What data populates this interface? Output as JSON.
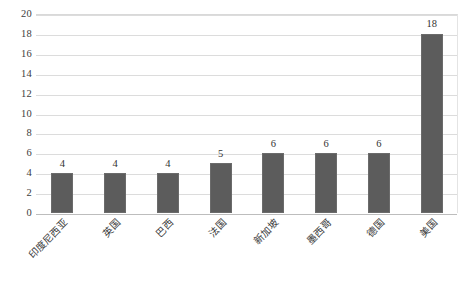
{
  "chart_data": {
    "type": "bar",
    "title": "",
    "subtitle": "",
    "xlabel": "",
    "ylabel": "",
    "categories": [
      "印度尼西亚",
      "英国",
      "巴西",
      "法国",
      "新加坡",
      "墨西哥",
      "德国",
      "美国"
    ],
    "values": [
      4,
      4,
      4,
      5,
      6,
      6,
      6,
      18
    ],
    "data_labels": [
      "4",
      "4",
      "4",
      "5",
      "6",
      "6",
      "6",
      "18"
    ],
    "ylim": [
      0,
      20
    ],
    "ytick_step": 2,
    "yticks": [
      "20",
      "18",
      "16",
      "14",
      "12",
      "10",
      "8",
      "6",
      "4",
      "2",
      "0"
    ],
    "grid": true,
    "grid_axis": "y",
    "legend": false,
    "legend_position": "none",
    "series": [
      {
        "name": "",
        "values": [
          4,
          4,
          4,
          5,
          6,
          6,
          6,
          18
        ]
      }
    ],
    "colors": {
      "bar_fill": "#5c5c5c",
      "bar_stroke": "#6b6b6b",
      "gridline": "#dcdcdc",
      "baseline": "#bdbdbd",
      "background": "#ffffff",
      "tick_text": "#3d3d3d",
      "label_text": "#3a3a3a"
    },
    "x_label_rotation": -45
  }
}
